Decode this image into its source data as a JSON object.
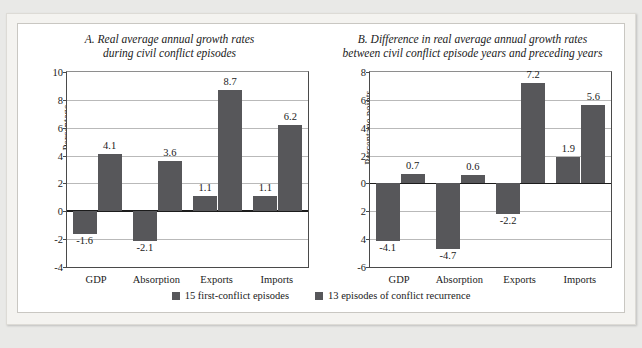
{
  "top_caption": "",
  "colors": {
    "bar": "#57575a",
    "axis": "#1c1c1c",
    "grid": "#b9b9b9",
    "frame": "#c9c7c2",
    "page_bg": "#e9e9e7",
    "panel_bg": "#ffffff"
  },
  "legend": {
    "items": [
      {
        "label": "15 first-conflict episodes"
      },
      {
        "label": "13 episodes of conflict recurrence"
      }
    ]
  },
  "chart_data": [
    {
      "type": "bar",
      "panel": "A",
      "title": "A. Real average annual growth rates during civil conflict episodes",
      "title_line1": "A. Real average annual growth rates",
      "title_line2": "during civil conflict episodes",
      "xlabel": "",
      "ylabel": "Percentage",
      "ylim": [
        -4,
        10
      ],
      "yticks": [
        10,
        8,
        6,
        4,
        2,
        0,
        -2,
        -4
      ],
      "ytick_labels": [
        "10",
        "8",
        "6",
        "4",
        "2",
        "0",
        "-2",
        "-4"
      ],
      "grid": true,
      "legend_position": "bottom",
      "categories": [
        "GDP",
        "Absorption",
        "Exports",
        "Imports"
      ],
      "series": [
        {
          "name": "15 first-conflict episodes",
          "values": [
            -1.6,
            -2.1,
            1.1,
            1.1
          ],
          "labels": [
            "-1.6",
            "-2.1",
            "1.1",
            "1.1"
          ]
        },
        {
          "name": "13 episodes of conflict recurrence",
          "values": [
            4.1,
            3.6,
            8.7,
            6.2
          ],
          "labels": [
            "4.1",
            "3.6",
            "8.7",
            "6.2"
          ]
        }
      ]
    },
    {
      "type": "bar",
      "panel": "B",
      "title": "B. Difference in real average annual growth rates between civil conflict episode years and preceding years",
      "title_line1": "B. Difference in real average annual growth rates",
      "title_line2": "between civil conflict episode years and preceding years",
      "xlabel": "",
      "ylabel": "Percentage points",
      "ylim": [
        -6,
        8
      ],
      "yticks": [
        8,
        6,
        4,
        2,
        0,
        -2,
        -4,
        -6
      ],
      "ytick_labels": [
        "8",
        "6",
        "4",
        "2",
        "0",
        "2",
        "4",
        "-6"
      ],
      "grid": true,
      "legend_position": "bottom",
      "categories": [
        "GDP",
        "Absorption",
        "Exports",
        "Imports"
      ],
      "series": [
        {
          "name": "15 first-conflict episodes",
          "values": [
            -4.1,
            -4.7,
            -2.2,
            1.9
          ],
          "labels": [
            "-4.1",
            "-4.7",
            "-2.2",
            "1.9"
          ]
        },
        {
          "name": "13 episodes of conflict recurrence",
          "values": [
            0.7,
            0.6,
            7.2,
            5.6
          ],
          "labels": [
            "0.7",
            "0.6",
            "7.2",
            "5.6"
          ]
        }
      ]
    }
  ]
}
